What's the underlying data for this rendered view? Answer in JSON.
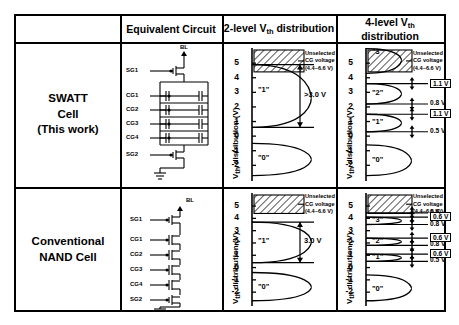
{
  "table": {
    "col_headers": [
      {
        "id": "blank",
        "label": ""
      },
      {
        "id": "equivalent-circuit",
        "label": "Equivalent Circuit"
      },
      {
        "id": "two-level",
        "label_pre": "2-level V",
        "label_sub": "th",
        "label_post": " distribution"
      },
      {
        "id": "four-level",
        "label_pre": "4-level V",
        "label_sub": "th",
        "label_post": " distribution"
      }
    ],
    "rows": [
      {
        "id": "swatt",
        "label_lines": [
          "SWATT",
          "Cell",
          "(This work)"
        ]
      },
      {
        "id": "conventional",
        "label_lines": [
          "Conventional",
          "NAND Cell"
        ]
      }
    ]
  },
  "circuit": {
    "bitline_label": "BL",
    "gate_labels": [
      "SG1",
      "CG1",
      "CG2",
      "CG3",
      "CG4",
      "SG2"
    ],
    "swatt_note": "paired-transistor cells in parallel",
    "conventional_note": "single transistors in series"
  },
  "axis": {
    "label_pre": "V",
    "label_sub": "th",
    "label_post": " distribution (V)",
    "ticks": [
      "5",
      "4",
      "3",
      "2",
      "1",
      "0",
      "-1",
      "-2"
    ],
    "ymin": -2.8,
    "ymax": 5.9
  },
  "unselected_note": {
    "line1": "Unselected",
    "line2": "CG voltage",
    "line3": "(4.4~6.6 V)",
    "band_low": 4.4,
    "band_high": 6.6
  },
  "chart_data": [
    {
      "id": "swatt-2level",
      "type": "area",
      "title_pre": "2-level V",
      "title_sub": "th",
      "title_post": " distribution",
      "row": "SWATT Cell (This work)",
      "ylabel": "Vth distribution (V)",
      "ylim": [
        -2.8,
        5.9
      ],
      "yticks": [
        5,
        4,
        3,
        2,
        1,
        0,
        -1,
        -2
      ],
      "states": [
        {
          "name": "\"1\"",
          "center": 2.6,
          "low": 0.6,
          "high": 4.9,
          "label_y": 3.1
        },
        {
          "name": "\"0\"",
          "center": -1.6,
          "low": -2.7,
          "high": -0.5,
          "label_y": -1.6
        }
      ],
      "margin_arrow": {
        "label": ">3.0 V",
        "from": 4.9,
        "to": 0.6
      },
      "hatched_band": {
        "low": 4.4,
        "high": 6.6,
        "label": "Unselected CG voltage (4.4~6.6 V)"
      }
    },
    {
      "id": "swatt-4level",
      "type": "area",
      "title_pre": "4-level V",
      "title_sub": "th",
      "title_post": " distribution",
      "row": "SWATT Cell (This work)",
      "ylabel": "Vth distribution (V)",
      "ylim": [
        -2.8,
        5.9
      ],
      "yticks": [
        5,
        4,
        3,
        2,
        1,
        0,
        -1,
        -2
      ],
      "states": [
        {
          "name": "\"3\"",
          "center": 5.2,
          "low": 4.3,
          "high": 6.0,
          "label_y": 5.7
        },
        {
          "name": "\"2\"",
          "center": 2.9,
          "low": 2.2,
          "high": 3.6,
          "label_y": 2.9
        },
        {
          "name": "\"1\"",
          "center": 0.9,
          "low": 0.3,
          "high": 1.5,
          "label_y": 0.9
        },
        {
          "name": "\"0\"",
          "center": -1.7,
          "low": -2.7,
          "high": -0.6,
          "label_y": -1.7
        }
      ],
      "interval_labels": [
        {
          "text": "1.1 V",
          "boxed": true,
          "y": 3.6
        },
        {
          "text": "0.8 V",
          "boxed": false,
          "y": 2.2
        },
        {
          "text": "1.1 V",
          "boxed": true,
          "y": 1.5
        },
        {
          "text": "0.5 V",
          "boxed": false,
          "y": 0.3
        }
      ],
      "hatched_band": {
        "low": 4.4,
        "high": 6.6,
        "label": "Unselected CG voltage (4.4~6.6 V)"
      }
    },
    {
      "id": "conventional-2level",
      "type": "area",
      "title_pre": "2-level V",
      "title_sub": "th",
      "title_post": " distribution",
      "row": "Conventional NAND Cell",
      "ylabel": "Vth distribution (V)",
      "ylim": [
        -2.8,
        5.9
      ],
      "yticks": [
        5,
        4,
        3,
        2,
        1,
        0,
        -1,
        -2
      ],
      "states": [
        {
          "name": "\"1\"",
          "center": 2.1,
          "low": 0.4,
          "high": 3.7,
          "label_y": 2.1
        },
        {
          "name": "\"0\"",
          "center": -1.6,
          "low": -2.7,
          "high": -0.4,
          "label_y": -1.7
        }
      ],
      "margin_arrow": {
        "label": "3.0 V",
        "from": 3.7,
        "to": 0.4
      },
      "hatched_band": {
        "low": 4.4,
        "high": 6.6,
        "label": "Unselected CG voltage (4.4~6.6 V)"
      }
    },
    {
      "id": "conventional-4level",
      "type": "area",
      "title_pre": "4-level V",
      "title_sub": "th",
      "title_post": " distribution",
      "row": "Conventional NAND Cell",
      "ylabel": "Vth distribution (V)",
      "ylim": [
        -2.8,
        5.9
      ],
      "yticks": [
        5,
        4,
        3,
        2,
        1,
        0,
        -1,
        -2
      ],
      "states": [
        {
          "name": "\"3\"",
          "center": 3.8,
          "low": 3.5,
          "high": 4.1,
          "label_y": 3.8
        },
        {
          "name": "\"2\"",
          "center": 2.1,
          "low": 1.8,
          "high": 2.4,
          "label_y": 2.1
        },
        {
          "name": "\"1\"",
          "center": 0.8,
          "low": 0.5,
          "high": 1.1,
          "label_y": 0.8
        },
        {
          "name": "\"0\"",
          "center": -1.7,
          "low": -2.7,
          "high": -0.6,
          "label_y": -1.8
        }
      ],
      "interval_labels": [
        {
          "text": "0.6 V",
          "boxed": false,
          "y": 4.45
        },
        {
          "text": "0.6 V",
          "boxed": true,
          "y": 4.1
        },
        {
          "text": "0.8 V",
          "boxed": false,
          "y": 3.5
        },
        {
          "text": "0.6 V",
          "boxed": true,
          "y": 2.4
        },
        {
          "text": "0.8 V",
          "boxed": false,
          "y": 1.8
        },
        {
          "text": "0.6 V",
          "boxed": true,
          "y": 1.1
        },
        {
          "text": "0.5 V",
          "boxed": false,
          "y": 0.5
        }
      ],
      "hatched_band": {
        "low": 4.4,
        "high": 6.6,
        "label": "Unselected CG voltage (4.4~6.6 V)"
      }
    }
  ]
}
